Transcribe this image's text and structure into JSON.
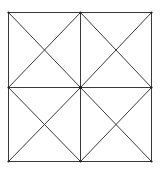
{
  "diagram": {
    "stroke_color": "#3a3a3a",
    "dot_color": "#222222",
    "background": "#ffffff",
    "square": {
      "x1": 8,
      "y1": 12,
      "x2": 151,
      "y2": 161
    },
    "mid": {
      "x": 80,
      "y": 87
    },
    "vertices": [
      {
        "name": "top-left",
        "x": 8,
        "y": 12
      },
      {
        "name": "top-mid",
        "x": 80,
        "y": 12
      },
      {
        "name": "top-right",
        "x": 151,
        "y": 12
      },
      {
        "name": "mid-left",
        "x": 8,
        "y": 87
      },
      {
        "name": "center",
        "x": 80,
        "y": 87
      },
      {
        "name": "mid-right",
        "x": 151,
        "y": 87
      },
      {
        "name": "bottom-left",
        "x": 8,
        "y": 161
      },
      {
        "name": "bottom-mid",
        "x": 80,
        "y": 161
      },
      {
        "name": "bottom-right",
        "x": 151,
        "y": 161
      }
    ]
  }
}
